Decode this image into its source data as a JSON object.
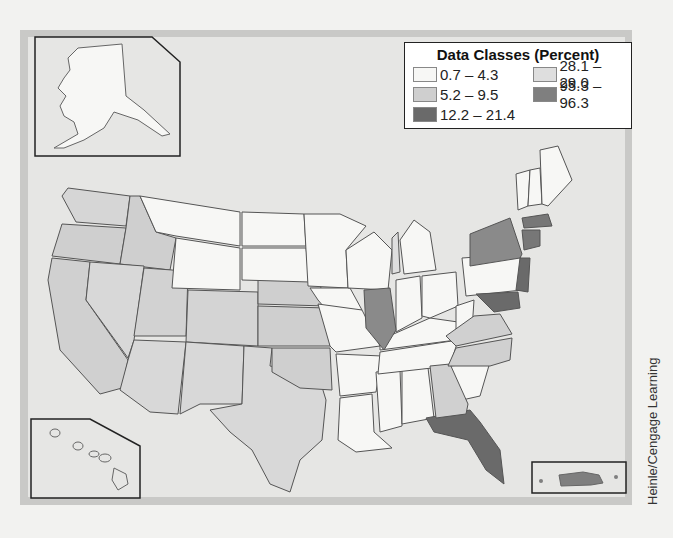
{
  "legend": {
    "title": "Data Classes (Percent)",
    "classes": [
      {
        "label": "0.7 – 4.3",
        "color": "#f7f7f5"
      },
      {
        "label": "28.1 – 29.0",
        "color": "#dedede"
      },
      {
        "label": "5.2 – 9.5",
        "color": "#cfcfcf"
      },
      {
        "label": "95.3 – 96.3",
        "color": "#7f7f7f"
      },
      {
        "label": "12.2 – 21.4",
        "color": "#6a6a6a"
      }
    ]
  },
  "insets": [
    "Alaska",
    "Hawaii",
    "Puerto Rico"
  ],
  "credit": "Heinle/Cengage Learning",
  "map_data": {
    "type": "choropleth",
    "region": "United States",
    "classes_by_state": {
      "0.7-4.3": [
        "MT",
        "WY",
        "ND",
        "SD",
        "MN",
        "WI",
        "IA",
        "MO",
        "AR",
        "LA",
        "MS",
        "AL",
        "TN",
        "KY",
        "IN",
        "OH",
        "WV",
        "PA",
        "SC",
        "VT",
        "NH",
        "ME",
        "MI",
        "AK",
        "HI"
      ],
      "5.2-9.5": [
        "WA",
        "OR",
        "ID",
        "CA",
        "NV",
        "UT",
        "CO",
        "AZ",
        "NM",
        "TX",
        "NE",
        "KS",
        "OK",
        "GA",
        "VA",
        "NC",
        "MI-Lower"
      ],
      "12.2-21.4": [
        "NY",
        "NJ",
        "MA",
        "CT",
        "RI",
        "MD",
        "DE",
        "FL",
        "IL"
      ],
      "95.3-96.3": [
        "PR"
      ]
    }
  }
}
